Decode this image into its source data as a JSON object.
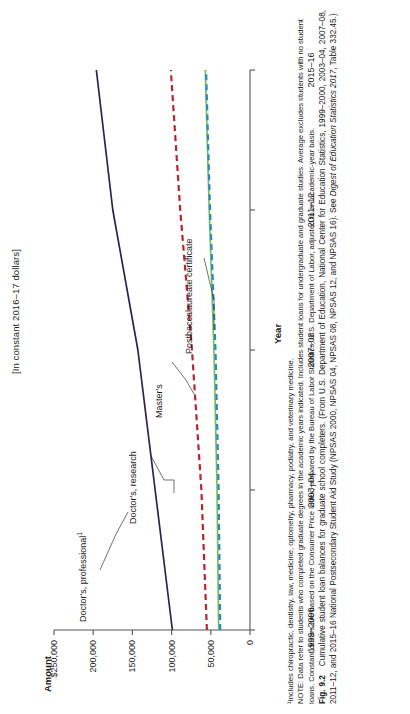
{
  "figure": {
    "subtitle": "[In constant 2016–17 dollars]",
    "footnote": "¹Includes chiropractic, dentistry, law, medicine, optometry, pharmacy, podiatry, and veterinary medicine.",
    "note": "NOTE: Data refer to students who completed graduate degrees in the academic years indicated. Includes student loans for undergraduate and graduate studies. Average excludes students with no student loans. Constant dollars are based on the Consumer Price Index, prepared by the Bureau of Labor Statistics, U.S. Department of Labor, adjusted to an academic-year basis.",
    "caption_number": "Fig. 9.2",
    "caption_text": "Cumulative student loan balances for graduate school completers. (From U.S. Department of Education, National Center for Education Statistics, 1999–2000, 2003–04, 2007–08, 2011–12, and 2015–16 National Postsecondary Student Aid Study (NPSAS 2000, NPSAS 04, NPSAS 08, NPSAS 12, and NPSAS 16). See ",
    "caption_italic": "Digest of Education Statistics 2017",
    "caption_tail": ", Table 332.45.)"
  },
  "chart_data": {
    "type": "line",
    "title": "",
    "subtitle": "[In constant 2016–17 dollars]",
    "xlabel": "Year",
    "ylabel": "Amount",
    "categories": [
      "1999–2000",
      "2003–04",
      "2007–08",
      "2011–12",
      "2015–16"
    ],
    "x_tick_labels": [
      "1999–2000",
      "2003–04",
      "2007–08",
      "2011–12",
      "2015–16"
    ],
    "y_tick_labels": [
      "$250,000",
      "200,000",
      "150,000",
      "100,000",
      "50,000",
      "0"
    ],
    "y_tick_values": [
      250000,
      200000,
      150000,
      100000,
      50000,
      0
    ],
    "ylim": [
      0,
      250000
    ],
    "grid": false,
    "legend": "inline-labels",
    "series": [
      {
        "name": "Doctor's, professional¹",
        "label": "Doctor's, professional",
        "label_superscript": "1",
        "color": "#2e2150",
        "style": "solid",
        "values": [
          99000,
          121000,
          143000,
          175000,
          196000
        ]
      },
      {
        "name": "Doctor's, research",
        "label": "Doctor's, research",
        "label_superscript": "",
        "color": "#b8252b",
        "style": "dashed",
        "values": [
          55000,
          62000,
          74000,
          89000,
          101000
        ]
      },
      {
        "name": "Master's",
        "label": "Master's",
        "label_superscript": "",
        "color": "#7bbf55",
        "style": "solid",
        "values": [
          40000,
          42000,
          46000,
          52000,
          57000
        ]
      },
      {
        "name": "Postbaccalaureate certificate",
        "label": "Postbaccalaureate certificate",
        "label_superscript": "",
        "color": "#2b87c4",
        "style": "dashed",
        "values": [
          38000,
          40000,
          44000,
          51000,
          56000
        ]
      }
    ]
  }
}
